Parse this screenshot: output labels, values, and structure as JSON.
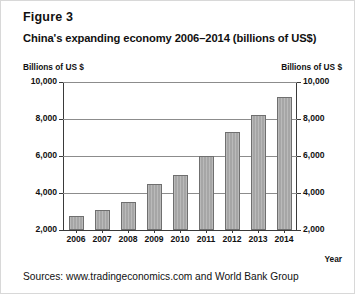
{
  "figure": {
    "label": "Figure 3",
    "title": "China's expanding economy 2006–2014 (billions of US$)",
    "sources": "Sources: www.tradingeconomics.com and World Bank Group"
  },
  "chart_data": {
    "type": "bar",
    "title": "China's expanding economy 2006–2014 (billions of US$)",
    "xlabel": "Year",
    "ylabel": "Billions of US $",
    "ylabel_right": "Billions of US $",
    "categories": [
      "2006",
      "2007",
      "2008",
      "2009",
      "2010",
      "2011",
      "2012",
      "2013",
      "2014"
    ],
    "values": [
      2750,
      3550,
      4600,
      5100,
      6100,
      7550,
      8560,
      9610,
      10480
    ],
    "values_plotted": [
      2750,
      3100,
      3500,
      4500,
      5000,
      6000,
      7300,
      8200,
      9200
    ],
    "yticks": [
      "2,000",
      "4,000",
      "6,000",
      "8,000",
      "10,000"
    ],
    "ytick_values": [
      2000,
      4000,
      6000,
      8000,
      10000
    ],
    "ylim": [
      2000,
      10000
    ],
    "grid": true,
    "legend": "none",
    "series_color": "#a6a6a6"
  }
}
